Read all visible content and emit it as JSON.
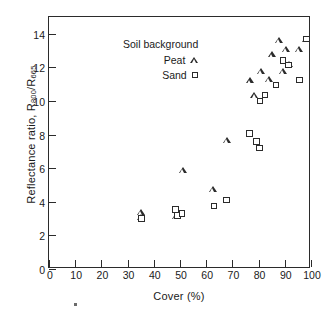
{
  "chart_data": {
    "type": "scatter",
    "title": "",
    "xlabel": "Cover (%)",
    "ylabel": "Reflectance ratio, R800/R665",
    "ylabel_main": "Reflectance ratio, R",
    "ylabel_sub1": "800",
    "ylabel_mid": "/R",
    "ylabel_sub2": "665",
    "xlim": [
      0,
      100
    ],
    "ylim": [
      0,
      15
    ],
    "xticks": [
      0,
      10,
      20,
      30,
      40,
      50,
      60,
      70,
      80,
      90,
      100
    ],
    "xtick_labels": [
      "0",
      "10",
      "20",
      "30",
      "40",
      "50",
      "60",
      "70",
      "80",
      "90",
      "100"
    ],
    "yticks": [
      0,
      2,
      4,
      6,
      8,
      10,
      12,
      14
    ],
    "ytick_labels": [
      "0",
      "2",
      "4",
      "6",
      "8",
      "10",
      "12",
      "14"
    ],
    "grid": false,
    "legend_position": "upper-left-inside",
    "legend_title": "Soil background",
    "series": [
      {
        "name": "Peat",
        "marker": "triangle",
        "color": "#2b2b2b",
        "points": [
          [
            35.3,
            3.35
          ],
          [
            35.3,
            3.05
          ],
          [
            48.5,
            3.15
          ],
          [
            50.6,
            3.25
          ],
          [
            51.2,
            5.85
          ],
          [
            62.8,
            4.75
          ],
          [
            67.9,
            7.65
          ],
          [
            76.6,
            11.2
          ],
          [
            78.5,
            10.35
          ],
          [
            80.8,
            11.75
          ],
          [
            83.9,
            11.3
          ],
          [
            85.2,
            12.75
          ],
          [
            88.0,
            13.6
          ],
          [
            89.4,
            11.75
          ],
          [
            90.4,
            13.05
          ],
          [
            91.5,
            12.2
          ],
          [
            95.5,
            13.05
          ],
          [
            98.3,
            13.65
          ]
        ]
      },
      {
        "name": "Sand",
        "marker": "square",
        "color": "#2b2b2b",
        "points": [
          [
            35.4,
            3.0
          ],
          [
            48.2,
            3.55
          ],
          [
            49.0,
            3.2
          ],
          [
            50.8,
            3.3
          ],
          [
            62.9,
            3.75
          ],
          [
            67.8,
            4.1
          ],
          [
            76.5,
            8.05
          ],
          [
            79.3,
            7.6
          ],
          [
            80.3,
            7.2
          ],
          [
            80.6,
            10.0
          ],
          [
            82.5,
            10.35
          ],
          [
            86.6,
            10.95
          ],
          [
            89.3,
            12.4
          ],
          [
            91.3,
            12.15
          ],
          [
            95.5,
            11.25
          ],
          [
            98.3,
            13.7
          ]
        ]
      }
    ]
  },
  "legend": {
    "title": "Soil background",
    "entries": [
      {
        "label": "Peat",
        "icon": "triangle-marker-icon"
      },
      {
        "label": "Sand",
        "icon": "square-marker-icon"
      }
    ]
  }
}
